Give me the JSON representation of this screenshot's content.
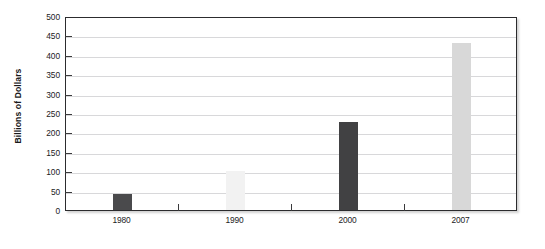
{
  "chart_data": {
    "type": "bar",
    "title": "",
    "subtitle": "",
    "xlabel": "",
    "ylabel": "Billions of Dollars",
    "categories": [
      "1980",
      "1990",
      "2000",
      "2007"
    ],
    "values": [
      40,
      100,
      228,
      430
    ],
    "bar_colors": [
      "#4a4a4c",
      "#f2f2f2",
      "#414143",
      "#d8d8d8"
    ],
    "ylim": [
      0,
      500
    ],
    "ytick_labels": [
      "0",
      "50",
      "100",
      "150",
      "200",
      "250",
      "300",
      "350",
      "400",
      "450",
      "500"
    ],
    "ytick_values": [
      0,
      50,
      100,
      150,
      200,
      250,
      300,
      350,
      400,
      450,
      500
    ],
    "ytick_step": 50,
    "grid": true,
    "grid_axis": "y",
    "legend": false,
    "legend_position": "none",
    "frame": true,
    "annotations": []
  }
}
